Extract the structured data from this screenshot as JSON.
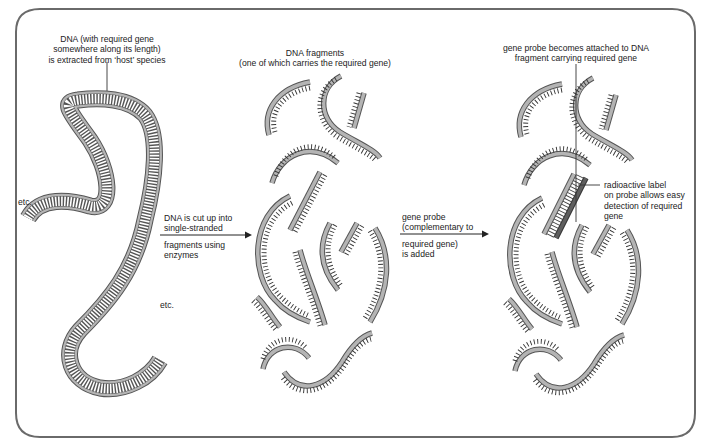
{
  "diagram": {
    "type": "process-flow",
    "colors": {
      "frame": "#6a6a6a",
      "strand_fill": "#b4b4b4",
      "strand_outline": "#555555",
      "probe_fill": "#5e5e5e",
      "text": "#222222",
      "background": "#ffffff"
    },
    "stages": [
      {
        "id": "host-dna",
        "caption_lines": [
          "DNA (with required gene",
          "somewhere along its length)",
          "is extracted from ‘host’ species"
        ],
        "end_labels": [
          "etc.",
          "etc."
        ]
      },
      {
        "id": "dna-fragments",
        "caption_lines": [
          "DNA fragments",
          "(one of which carries the required gene)"
        ]
      },
      {
        "id": "probe-attached",
        "caption_lines": [
          "gene probe becomes attached to DNA",
          "fragment carrying required gene"
        ],
        "probe_label_lines": [
          "radioactive label",
          "on probe allows easy",
          "detection of required",
          "gene"
        ]
      }
    ],
    "arrows": [
      {
        "id": "arrow-cut",
        "above_lines": [
          "DNA is cut up into",
          "single-stranded"
        ],
        "below_lines": [
          "fragments using",
          "enzymes"
        ]
      },
      {
        "id": "arrow-probe",
        "above_lines": [
          "gene probe",
          "(complementary to"
        ],
        "below_lines": [
          "required gene)",
          "is added"
        ]
      }
    ]
  }
}
